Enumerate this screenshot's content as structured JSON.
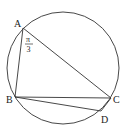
{
  "diagram": {
    "type": "circle-inscribed-quadrilateral",
    "circle": {
      "cx": 63,
      "cy": 68,
      "r": 56
    },
    "points": {
      "A": {
        "x": 23,
        "y": 28,
        "label": "A"
      },
      "B": {
        "x": 15,
        "y": 97,
        "label": "B"
      },
      "C": {
        "x": 111,
        "y": 98,
        "label": "C"
      },
      "D": {
        "x": 101,
        "y": 111,
        "label": "D"
      }
    },
    "segments": [
      "AB",
      "AC",
      "BC",
      "BD",
      "CD"
    ],
    "angle_label": {
      "vertex": "A",
      "numerator": "π",
      "denominator": "3"
    },
    "stroke_color": "#333333"
  }
}
